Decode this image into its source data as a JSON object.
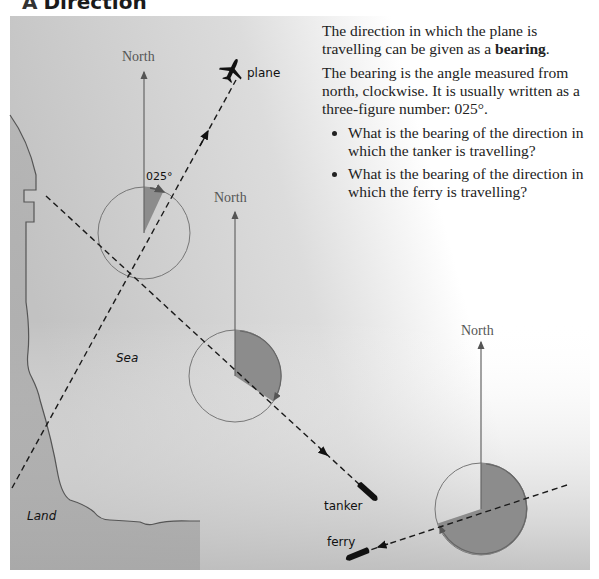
{
  "heading": {
    "letter": "A",
    "title": "Direction"
  },
  "text": {
    "para1_before": "The direction in which the plane is travelling can be given as a ",
    "para1_bold": "bearing",
    "para1_after": ".",
    "para2": "The bearing is the angle measured from north, clockwise. It is usually written as a three-figure number: 025°.",
    "questions": [
      "What is the bearing of the direction in which the tanker is travelling?",
      "What is the bearing of the direction in which the ferry is travelling?"
    ]
  },
  "diagram": {
    "labels": {
      "north": "North",
      "angle_plane": "025°",
      "plane": "plane",
      "tanker": "tanker",
      "ferry": "ferry",
      "sea": "Sea",
      "land": "Land"
    },
    "bearings": {
      "plane": "025°"
    },
    "colors": {
      "sea": "#c9c9c9",
      "land": "#a8a8a8",
      "sector": "#8c8c8c",
      "line": "#666666",
      "track": "#1a1a1a"
    }
  }
}
